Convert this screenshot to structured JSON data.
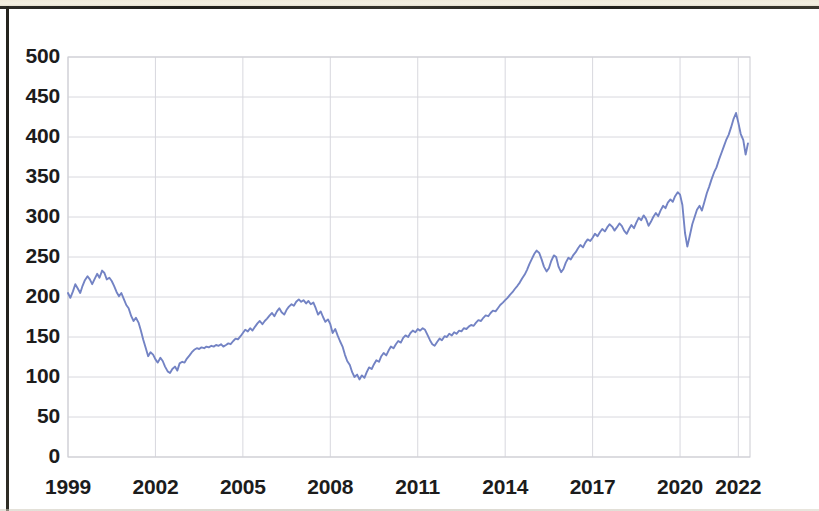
{
  "chart_data": {
    "type": "line",
    "title": "",
    "subtitle": "",
    "xlabel": "",
    "ylabel": "",
    "xlim": [
      1999,
      2022.4
    ],
    "ylim": [
      0,
      500
    ],
    "grid": true,
    "legend": false,
    "legend_position": "none",
    "line_color": "#7383c4",
    "line_width": 1.9,
    "gridline_color": "#d8d8de",
    "axis_label_color": "#1c1c1c",
    "plot_background": "#ffffff",
    "y_ticks": [
      0,
      50,
      100,
      150,
      200,
      250,
      300,
      350,
      400,
      450,
      500
    ],
    "y_tick_labels": [
      "0",
      "50",
      "100",
      "150",
      "200",
      "250",
      "300",
      "350",
      "400",
      "450",
      "500"
    ],
    "x_ticks": [
      1999,
      2002,
      2005,
      2008,
      2011,
      2014,
      2017,
      2020,
      2022
    ],
    "x_tick_labels": [
      "1999",
      "2002",
      "2005",
      "2008",
      "2011",
      "2014",
      "2017",
      "2020",
      "2022"
    ],
    "series": [
      {
        "name": "index",
        "color": "#7383c4",
        "x": [
          1999.0,
          1999.08,
          1999.17,
          1999.25,
          1999.33,
          1999.42,
          1999.5,
          1999.58,
          1999.67,
          1999.75,
          1999.83,
          1999.92,
          2000.0,
          2000.08,
          2000.17,
          2000.25,
          2000.33,
          2000.42,
          2000.5,
          2000.58,
          2000.67,
          2000.75,
          2000.83,
          2000.92,
          2001.0,
          2001.08,
          2001.17,
          2001.25,
          2001.33,
          2001.42,
          2001.5,
          2001.58,
          2001.67,
          2001.75,
          2001.83,
          2001.92,
          2002.0,
          2002.08,
          2002.17,
          2002.25,
          2002.33,
          2002.42,
          2002.5,
          2002.58,
          2002.67,
          2002.75,
          2002.83,
          2002.92,
          2003.0,
          2003.08,
          2003.17,
          2003.25,
          2003.33,
          2003.42,
          2003.5,
          2003.58,
          2003.67,
          2003.75,
          2003.83,
          2003.92,
          2004.0,
          2004.08,
          2004.17,
          2004.25,
          2004.33,
          2004.42,
          2004.5,
          2004.58,
          2004.67,
          2004.75,
          2004.83,
          2004.92,
          2005.0,
          2005.08,
          2005.17,
          2005.25,
          2005.33,
          2005.42,
          2005.5,
          2005.58,
          2005.67,
          2005.75,
          2005.83,
          2005.92,
          2006.0,
          2006.08,
          2006.17,
          2006.25,
          2006.33,
          2006.42,
          2006.5,
          2006.58,
          2006.67,
          2006.75,
          2006.83,
          2006.92,
          2007.0,
          2007.08,
          2007.17,
          2007.25,
          2007.33,
          2007.42,
          2007.5,
          2007.58,
          2007.67,
          2007.75,
          2007.83,
          2007.92,
          2008.0,
          2008.08,
          2008.17,
          2008.25,
          2008.33,
          2008.42,
          2008.5,
          2008.58,
          2008.67,
          2008.75,
          2008.83,
          2008.92,
          2009.0,
          2009.08,
          2009.17,
          2009.25,
          2009.33,
          2009.42,
          2009.5,
          2009.58,
          2009.67,
          2009.75,
          2009.83,
          2009.92,
          2010.0,
          2010.08,
          2010.17,
          2010.25,
          2010.33,
          2010.42,
          2010.5,
          2010.58,
          2010.67,
          2010.75,
          2010.83,
          2010.92,
          2011.0,
          2011.08,
          2011.17,
          2011.25,
          2011.33,
          2011.42,
          2011.5,
          2011.58,
          2011.67,
          2011.75,
          2011.83,
          2011.92,
          2012.0,
          2012.08,
          2012.17,
          2012.25,
          2012.33,
          2012.42,
          2012.5,
          2012.58,
          2012.67,
          2012.75,
          2012.83,
          2012.92,
          2013.0,
          2013.08,
          2013.17,
          2013.25,
          2013.33,
          2013.42,
          2013.5,
          2013.58,
          2013.67,
          2013.75,
          2013.83,
          2013.92,
          2014.0,
          2014.08,
          2014.17,
          2014.25,
          2014.33,
          2014.42,
          2014.5,
          2014.58,
          2014.67,
          2014.75,
          2014.83,
          2014.92,
          2015.0,
          2015.08,
          2015.17,
          2015.25,
          2015.33,
          2015.42,
          2015.5,
          2015.58,
          2015.67,
          2015.75,
          2015.83,
          2015.92,
          2016.0,
          2016.08,
          2016.17,
          2016.25,
          2016.33,
          2016.42,
          2016.5,
          2016.58,
          2016.67,
          2016.75,
          2016.83,
          2016.92,
          2017.0,
          2017.08,
          2017.17,
          2017.25,
          2017.33,
          2017.42,
          2017.5,
          2017.58,
          2017.67,
          2017.75,
          2017.83,
          2017.92,
          2018.0,
          2018.08,
          2018.17,
          2018.25,
          2018.33,
          2018.42,
          2018.5,
          2018.58,
          2018.67,
          2018.75,
          2018.83,
          2018.92,
          2019.0,
          2019.08,
          2019.17,
          2019.25,
          2019.33,
          2019.42,
          2019.5,
          2019.58,
          2019.67,
          2019.75,
          2019.83,
          2019.92,
          2020.0,
          2020.08,
          2020.17,
          2020.25,
          2020.33,
          2020.42,
          2020.5,
          2020.58,
          2020.67,
          2020.75,
          2020.83,
          2020.92,
          2021.0,
          2021.08,
          2021.17,
          2021.25,
          2021.33,
          2021.42,
          2021.5,
          2021.58,
          2021.67,
          2021.75,
          2021.83,
          2021.92,
          2022.0,
          2022.08,
          2022.17,
          2022.25,
          2022.33
        ],
        "values": [
          205,
          199,
          207,
          216,
          211,
          205,
          214,
          221,
          226,
          222,
          216,
          223,
          229,
          224,
          233,
          230,
          222,
          224,
          220,
          214,
          206,
          201,
          205,
          197,
          190,
          186,
          176,
          170,
          174,
          168,
          158,
          147,
          136,
          126,
          131,
          128,
          122,
          118,
          124,
          120,
          113,
          107,
          105,
          110,
          113,
          108,
          117,
          119,
          118,
          123,
          127,
          131,
          134,
          136,
          135,
          137,
          136,
          138,
          137,
          139,
          138,
          140,
          139,
          141,
          138,
          140,
          142,
          141,
          145,
          148,
          147,
          151,
          155,
          159,
          157,
          161,
          158,
          163,
          167,
          170,
          166,
          170,
          173,
          177,
          180,
          176,
          182,
          186,
          181,
          178,
          184,
          188,
          191,
          189,
          194,
          197,
          194,
          196,
          192,
          195,
          191,
          193,
          186,
          178,
          182,
          175,
          169,
          172,
          166,
          155,
          160,
          152,
          145,
          138,
          128,
          120,
          115,
          106,
          100,
          103,
          97,
          102,
          99,
          106,
          112,
          110,
          116,
          121,
          119,
          126,
          130,
          127,
          133,
          138,
          136,
          141,
          145,
          143,
          149,
          152,
          150,
          155,
          158,
          156,
          160,
          158,
          161,
          159,
          153,
          146,
          141,
          139,
          144,
          148,
          146,
          151,
          150,
          154,
          152,
          156,
          154,
          158,
          157,
          161,
          160,
          163,
          165,
          164,
          168,
          171,
          170,
          174,
          177,
          176,
          180,
          183,
          182,
          186,
          190,
          193,
          196,
          199,
          203,
          206,
          210,
          214,
          218,
          223,
          228,
          234,
          241,
          248,
          254,
          258,
          255,
          247,
          238,
          232,
          236,
          245,
          252,
          250,
          238,
          231,
          235,
          243,
          249,
          247,
          252,
          256,
          261,
          265,
          262,
          268,
          272,
          270,
          274,
          279,
          276,
          281,
          285,
          282,
          287,
          291,
          288,
          283,
          287,
          292,
          289,
          283,
          279,
          285,
          290,
          286,
          293,
          299,
          296,
          302,
          298,
          289,
          294,
          300,
          305,
          301,
          308,
          314,
          311,
          318,
          322,
          319,
          326,
          331,
          328,
          315,
          280,
          263,
          276,
          291,
          300,
          309,
          314,
          308,
          318,
          330,
          338,
          347,
          356,
          362,
          371,
          380,
          388,
          396,
          403,
          412,
          422,
          430,
          418,
          404,
          396,
          378,
          392
        ]
      }
    ]
  },
  "axes": {
    "y_labels": [
      "500",
      "450",
      "400",
      "350",
      "300",
      "250",
      "200",
      "150",
      "100",
      "50",
      "0"
    ],
    "x_labels": [
      "1999",
      "2002",
      "2005",
      "2008",
      "2011",
      "2014",
      "2017",
      "2020",
      "2022"
    ]
  }
}
